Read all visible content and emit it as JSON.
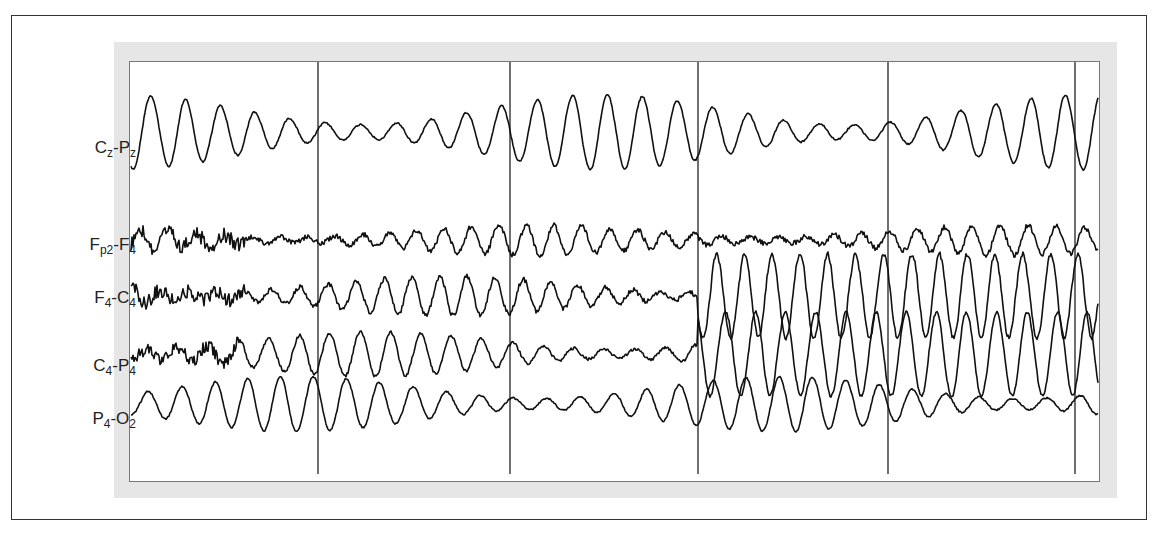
{
  "figure": {
    "type": "EEG tracing",
    "channels": [
      {
        "id": "cz-pz",
        "main": "C",
        "sub1": "z",
        "sep": "-",
        "main2": "P",
        "sub2": "z",
        "label_y": 152,
        "baseline": 132,
        "amp": 30,
        "freq": 0.095,
        "noise": 0.15,
        "segments": [
          [
            0,
            1
          ]
        ]
      },
      {
        "id": "fp2-f4",
        "main": "F",
        "sub1": "p2",
        "sep": "-",
        "main2": "F",
        "sub2": "4",
        "label_y": 249,
        "baseline": 240,
        "amp": 12,
        "freq": 0.12,
        "noise": 0.5,
        "segments": [
          [
            0,
            1
          ]
        ]
      },
      {
        "id": "f4-c4",
        "main": "F",
        "sub1": "4",
        "sep": "-",
        "main2": "C",
        "sub2": "4",
        "label_y": 302,
        "baseline": 296,
        "amp": 16,
        "freq": 0.12,
        "noise": 0.45,
        "segments": [
          [
            0,
            1
          ]
        ]
      },
      {
        "id": "c4-p4",
        "main": "C",
        "sub1": "4",
        "sep": "-",
        "main2": "P",
        "sub2": "4",
        "label_y": 370,
        "baseline": 354,
        "amp": 18,
        "freq": 0.11,
        "noise": 0.3,
        "segments": [
          [
            0,
            1
          ]
        ]
      },
      {
        "id": "p4-o2",
        "main": "P",
        "sub1": "4",
        "sep": "-",
        "main2": "O",
        "sub2": "2",
        "label_y": 423,
        "baseline": 404,
        "amp": 22,
        "freq": 0.1,
        "noise": 0.15,
        "segments": [
          [
            0,
            1
          ]
        ]
      }
    ],
    "epoch_marker_x": [
      318,
      510,
      698,
      888,
      1075
    ],
    "high_amplitude_segment": {
      "channels": [
        "f4-c4",
        "c4-p4"
      ],
      "x_start": 698,
      "x_end": 1100,
      "amp": 42
    }
  }
}
